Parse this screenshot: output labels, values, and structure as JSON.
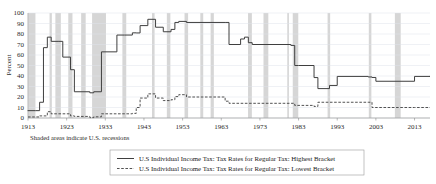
{
  "chart_data": {
    "type": "line",
    "title": "",
    "subtitle": "",
    "xlabel": "",
    "ylabel": "Percent",
    "xlim": [
      1913,
      2017
    ],
    "ylim": [
      0,
      100
    ],
    "grid": true,
    "legend_position": "bottom",
    "x_ticks": [
      1913,
      1923,
      1933,
      1943,
      1953,
      1963,
      1973,
      1983,
      1993,
      2003,
      2013
    ],
    "y_ticks": [
      0,
      10,
      20,
      30,
      40,
      50,
      60,
      70,
      80,
      90,
      100
    ],
    "annotation": "Shaded areas indicate U.S. recessions",
    "accent_color": "#3f3f3f",
    "recession_band_color": "#cfcfcf",
    "gridline_color": "#dfe3ea",
    "series": [
      {
        "name": "U.S Individual Income Tax: Tax Rates for Regular Tax: Highest Bracket",
        "style": "solid",
        "x": [
          1913,
          1915,
          1916,
          1917,
          1918,
          1919,
          1921,
          1922,
          1924,
          1925,
          1929,
          1930,
          1932,
          1936,
          1938,
          1940,
          1941,
          1942,
          1944,
          1946,
          1948,
          1950,
          1951,
          1952,
          1954,
          1964,
          1965,
          1968,
          1969,
          1970,
          1971,
          1981,
          1982,
          1983,
          1987,
          1988,
          1991,
          1993,
          2001,
          2002,
          2003,
          2013,
          2017
        ],
        "y": [
          7,
          7,
          15,
          67,
          77,
          73,
          73,
          58,
          46,
          25,
          24,
          25,
          63,
          79,
          79,
          81.1,
          81,
          88,
          94,
          86.45,
          82.13,
          84.36,
          91,
          92,
          91,
          91,
          70,
          75.25,
          77,
          71.75,
          70,
          69.125,
          50,
          50,
          38.5,
          28,
          31,
          39.6,
          39.1,
          38.6,
          35,
          39.6,
          39.6
        ]
      },
      {
        "name": "U.S Individual Income Tax: Tax Rates for Regular Tax: Lowest Bracket",
        "style": "dashed",
        "x": [
          1913,
          1916,
          1917,
          1918,
          1919,
          1922,
          1924,
          1925,
          1929,
          1930,
          1932,
          1936,
          1940,
          1941,
          1942,
          1944,
          1946,
          1948,
          1950,
          1951,
          1952,
          1954,
          1964,
          1965,
          1971,
          1979,
          1982,
          1987,
          1988,
          1991,
          1993,
          2001,
          2002,
          2003,
          2013,
          2017
        ],
        "y": [
          1,
          2,
          2,
          6,
          4,
          4,
          2,
          1.5,
          0.375,
          1.125,
          4,
          4,
          4.4,
          10,
          19,
          23,
          19,
          16.6,
          17.4,
          20.4,
          22.2,
          20,
          16,
          14,
          14,
          14,
          12,
          11,
          15,
          15,
          15,
          15,
          10,
          10,
          10,
          10
        ]
      }
    ],
    "recessions": [
      [
        1913.08,
        1914.92
      ],
      [
        1918.58,
        1919.17
      ],
      [
        1920.08,
        1921.5
      ],
      [
        1923.42,
        1924.5
      ],
      [
        1926.75,
        1927.92
      ],
      [
        1929.58,
        1933.17
      ],
      [
        1937.42,
        1938.42
      ],
      [
        1945.08,
        1945.75
      ],
      [
        1948.92,
        1949.83
      ],
      [
        1953.5,
        1954.42
      ],
      [
        1957.58,
        1958.33
      ],
      [
        1960.25,
        1961.08
      ],
      [
        1969.92,
        1970.92
      ],
      [
        1973.92,
        1975.17
      ],
      [
        1980.08,
        1980.5
      ],
      [
        1981.5,
        1982.92
      ],
      [
        1990.5,
        1991.17
      ],
      [
        2001.17,
        2001.83
      ],
      [
        2007.92,
        2009.42
      ]
    ]
  },
  "legend": {
    "items": [
      {
        "label": "U.S Individual Income Tax: Tax Rates for Regular Tax: Highest Bracket",
        "style": "solid"
      },
      {
        "label": "U.S Individual Income Tax: Tax Rates for Regular Tax: Lowest Bracket",
        "style": "dashed"
      }
    ]
  }
}
